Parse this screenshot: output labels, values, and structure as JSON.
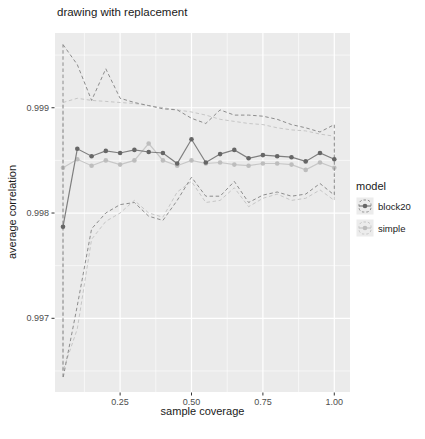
{
  "title": "drawing with replacement",
  "axes": {
    "x_label": "sample coverage",
    "y_label": "average correlation"
  },
  "legend": {
    "title": "model",
    "items": [
      {
        "label": "block20",
        "series": "block20"
      },
      {
        "label": "simple",
        "series": "simple"
      }
    ]
  },
  "chart_data": {
    "type": "line",
    "title": "drawing with replacement",
    "xlabel": "sample coverage",
    "ylabel": "average correlation",
    "legend_position": "right",
    "grid": true,
    "panel_bg": "#ebebeb",
    "grid_color": "#ffffff",
    "tick_color": "#333333",
    "tick_label_color": "#4d4d4d",
    "xlim": [
      0.022,
      1.055
    ],
    "ylim": [
      0.9963,
      0.99971
    ],
    "x_ticks": [
      {
        "v": 0.25,
        "label": "0.25"
      },
      {
        "v": 0.5,
        "label": "0.50"
      },
      {
        "v": 0.75,
        "label": "0.75"
      },
      {
        "v": 1.0,
        "label": "1.00"
      }
    ],
    "y_ticks": [
      {
        "v": 0.999,
        "label": "0.999"
      },
      {
        "v": 0.998,
        "label": "0.998"
      },
      {
        "v": 0.997,
        "label": "0.997"
      }
    ],
    "x_minor": [
      0.125,
      0.375,
      0.625,
      0.875
    ],
    "y_minor": [
      0.9965,
      0.9975,
      0.9985,
      0.9995
    ],
    "x": [
      0.05,
      0.1,
      0.15,
      0.2,
      0.25,
      0.3,
      0.35,
      0.4,
      0.45,
      0.5,
      0.55,
      0.6,
      0.65,
      0.7,
      0.75,
      0.8,
      0.85,
      0.9,
      0.95,
      1.0
    ],
    "series": [
      {
        "name": "simple",
        "line_color": "#c7c7c7",
        "point_color": "#bdbdbd",
        "dash_color": "#c6c6c6",
        "mean": [
          0.99843,
          0.99851,
          0.99845,
          0.9985,
          0.99846,
          0.9985,
          0.99866,
          0.9985,
          0.99845,
          0.9985,
          0.99847,
          0.99848,
          0.99846,
          0.99845,
          0.99847,
          0.99847,
          0.99846,
          0.99841,
          0.99848,
          0.99843
        ],
        "upper": [
          0.99905,
          0.99909,
          0.99907,
          0.99906,
          0.99905,
          0.99904,
          0.99902,
          0.999,
          0.99898,
          0.99896,
          0.99893,
          0.99889,
          0.99887,
          0.99885,
          0.99884,
          0.99881,
          0.99879,
          0.99878,
          0.99875,
          0.99873
        ],
        "lower": [
          0.9965,
          0.9969,
          0.99775,
          0.99792,
          0.998,
          0.99812,
          0.998,
          0.99796,
          0.9982,
          0.9983,
          0.9981,
          0.99812,
          0.99824,
          0.99806,
          0.99814,
          0.99818,
          0.99812,
          0.99814,
          0.99822,
          0.99812
        ]
      },
      {
        "name": "block20",
        "line_color": "#7f7f7f",
        "point_color": "#666666",
        "dash_color": "#8c8c8c",
        "mean": [
          0.99787,
          0.99861,
          0.99854,
          0.99859,
          0.99857,
          0.9986,
          0.99858,
          0.99857,
          0.99847,
          0.9987,
          0.99848,
          0.99856,
          0.9986,
          0.99852,
          0.99855,
          0.99854,
          0.99853,
          0.99849,
          0.99857,
          0.99851
        ],
        "upper": [
          0.9996,
          0.99941,
          0.99907,
          0.99937,
          0.99909,
          0.99905,
          0.99902,
          0.99899,
          0.99898,
          0.9989,
          0.99885,
          0.99898,
          0.99893,
          0.99893,
          0.99892,
          0.99889,
          0.99884,
          0.99881,
          0.99877,
          0.99884
        ],
        "lower": [
          0.99643,
          0.99712,
          0.99785,
          0.998,
          0.99808,
          0.9981,
          0.99797,
          0.99793,
          0.99812,
          0.99834,
          0.99816,
          0.99816,
          0.9983,
          0.9981,
          0.99817,
          0.9982,
          0.99816,
          0.99818,
          0.99828,
          0.99817
        ]
      }
    ]
  }
}
